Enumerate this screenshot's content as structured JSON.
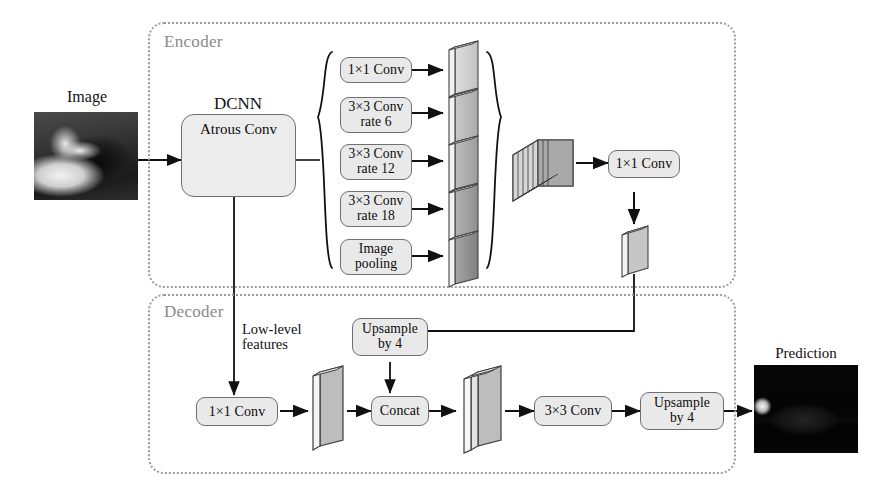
{
  "figure": {
    "type": "diagram"
  },
  "input": {
    "label": "Image",
    "thumbnail_name": "input-photo-grayscale"
  },
  "output": {
    "label": "Prediction",
    "thumbnail_name": "prediction-photo-grayscale"
  },
  "encoder": {
    "label": "Encoder",
    "backbone": {
      "title": "DCNN",
      "inner_label": "Atrous Conv"
    },
    "aspp_branches": [
      {
        "id": "b1",
        "line1": "1×1 Conv",
        "line2": ""
      },
      {
        "id": "b2",
        "line1": "3×3 Conv",
        "line2": "rate 6"
      },
      {
        "id": "b3",
        "line1": "3×3 Conv",
        "line2": "rate 12"
      },
      {
        "id": "b4",
        "line1": "3×3 Conv",
        "line2": "rate 18"
      },
      {
        "id": "b5",
        "line1": "Image",
        "line2": "pooling"
      }
    ],
    "fuse_conv": "1×1 Conv"
  },
  "decoder": {
    "label": "Decoder",
    "low_level_label_line1": "Low-level",
    "low_level_label_line2": "features",
    "low_level_conv": "1×1 Conv",
    "upsample_top": {
      "line1": "Upsample",
      "line2": "by 4"
    },
    "concat": "Concat",
    "refine_conv": "3×3 Conv",
    "upsample_out": {
      "line1": "Upsample",
      "line2": "by 4"
    }
  },
  "colors": {
    "box_fill": "#e9e9e9",
    "box_stroke": "#6f6f6f",
    "group_dashed": "#9b9b9b",
    "group_label": "#8a8a8a",
    "arrow": "#111111",
    "slab_face_light": "#d3d3d3",
    "slab_face_mid": "#a8a8a8",
    "slab_face_dark": "#8b8b8b",
    "slab_top": "#f0f0f0"
  }
}
